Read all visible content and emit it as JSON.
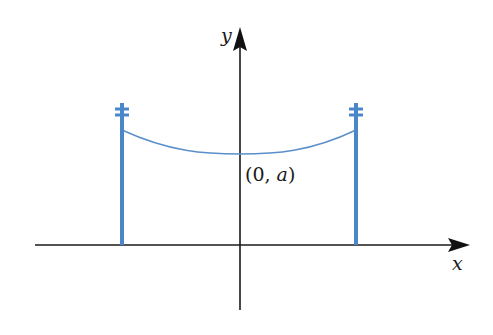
{
  "diagram": {
    "axes": {
      "x_label": "x",
      "y_label": "y"
    },
    "point_label": {
      "open": "(0, ",
      "var": "a",
      "close": ")"
    },
    "colors": {
      "axis": "#1a1a1a",
      "pole": "#4a86c8",
      "cable": "#5b8fc9"
    },
    "poles": [
      {
        "side": "left"
      },
      {
        "side": "right"
      }
    ]
  }
}
